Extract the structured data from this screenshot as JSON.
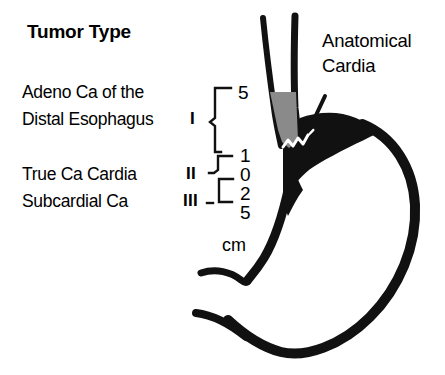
{
  "figure": {
    "title": "Tumor Type",
    "background_color": "#ffffff",
    "ink_color": "#000000",
    "tumor_fill_color": "#8a8a8a"
  },
  "classification": {
    "types": [
      {
        "roman": "I",
        "name_line1": "Adeno Ca of the",
        "name_line2": "Distal Esophagus"
      },
      {
        "roman": "II",
        "name_line1": "True Ca Cardia",
        "name_line2": ""
      },
      {
        "roman": "III",
        "name_line1": "Subcardial Ca",
        "name_line2": ""
      }
    ]
  },
  "scale": {
    "unit": "cm",
    "ticks": [
      {
        "value": "5"
      },
      {
        "value": "1"
      },
      {
        "value": "0"
      },
      {
        "value": "2"
      },
      {
        "value": "5"
      }
    ]
  },
  "annotations": {
    "anatomical_cardia_line1": "Anatomical",
    "anatomical_cardia_line2": "Cardia"
  }
}
